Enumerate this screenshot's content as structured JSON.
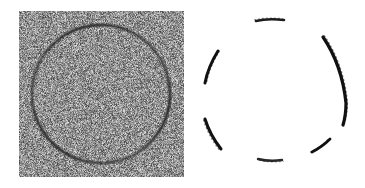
{
  "figure": {
    "background_color": "#ffffff",
    "width": 365,
    "height": 188,
    "panel_count": 2
  },
  "panels": [
    {
      "name": "noisy-input-image",
      "kind": "raster-noise-image",
      "label": "",
      "x": 19,
      "y": 11,
      "width": 165,
      "height": 166,
      "noise": {
        "type": "uniform-grayscale-speckle",
        "mean_gray": "#8c8c8c",
        "min_gray": "#3c3c3c",
        "max_gray": "#e8e8e8",
        "grain_px": 1,
        "amplitude": 0.62
      },
      "shape": {
        "type": "circle",
        "center_x": 82,
        "center_y": 83,
        "radius": 69,
        "stroke_color": "#2a2a2a",
        "stroke_width": 2.2,
        "contrast": "low",
        "description": "dark ring embedded in heavy additive noise"
      }
    },
    {
      "name": "arc-fragments-output",
      "kind": "binary-edge-fragments",
      "label": "",
      "x": 196,
      "y": 11,
      "width": 165,
      "height": 166,
      "background_color": "#ffffff",
      "stroke_color": "#111111",
      "reference_circle": {
        "center_x": 79,
        "center_y": 80,
        "radius": 71
      },
      "fragments": [
        {
          "id": "top-dash",
          "name": "fragment-top",
          "start_angle_deg": 258,
          "end_angle_deg": 283,
          "stroke_width": 2.6,
          "opacity": 0.95,
          "path": "M 60 10 Q 72 7 88 9",
          "note": "short near-horizontal dash at top of circle, slightly fuzzy"
        },
        {
          "id": "upper-left-arc",
          "name": "fragment-upper-left",
          "start_angle_deg": 160,
          "end_angle_deg": 196,
          "stroke_width": 3.0,
          "opacity": 1.0,
          "path": "M 22 40 Q 12 56 9 72",
          "note": "tapered arc on upper-left, tilted upper-right to lower-left"
        },
        {
          "id": "lower-left-arc",
          "name": "fragment-lower-left",
          "start_angle_deg": 118,
          "end_angle_deg": 152,
          "stroke_width": 3.0,
          "opacity": 1.0,
          "path": "M 9 108 Q 14 124 25 138",
          "note": "tapered arc on lower-left, tilted upper-left to lower-right"
        },
        {
          "id": "right-long-arc",
          "name": "fragment-right-long",
          "start_angle_deg": 297,
          "end_angle_deg": 17,
          "stroke_width": 3.2,
          "opacity": 1.0,
          "path": "M 127 26 Q 146 54 150 92 Q 150 104 147 114",
          "note": "longest fragment, sweeps down the right side of the circle"
        },
        {
          "id": "lower-right-dash",
          "name": "fragment-lower-right",
          "start_angle_deg": 52,
          "end_angle_deg": 74,
          "stroke_width": 2.8,
          "opacity": 1.0,
          "path": "M 116 141 Q 126 136 134 128",
          "note": "short diagonal dash at lower-right"
        },
        {
          "id": "bottom-dash",
          "name": "fragment-bottom",
          "start_angle_deg": 84,
          "end_angle_deg": 104,
          "stroke_width": 2.4,
          "opacity": 0.9,
          "path": "M 62 148 Q 74 151 86 149",
          "note": "fuzzy near-horizontal dash at bottom of circle"
        }
      ]
    }
  ]
}
